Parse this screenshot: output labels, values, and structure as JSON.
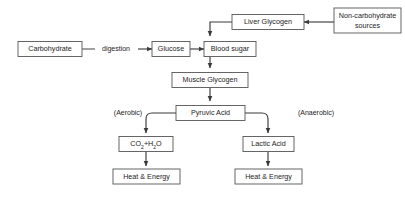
{
  "diagram": {
    "background_color": "#ffffff",
    "box_border_color": "#555555",
    "arrow_color": "#3a3a3a",
    "text_color": "#1c1c1c",
    "nodes": [
      {
        "id": "carbohydrate",
        "label": "Carbohydrate"
      },
      {
        "id": "glucose",
        "label": "Glucose"
      },
      {
        "id": "blood-sugar",
        "label": "Blood sugar"
      },
      {
        "id": "liver-glycogen",
        "label": "Liver Glycogen"
      },
      {
        "id": "non-carb-sources",
        "label_line1": "Non-carbohydrate",
        "label_line2": "sources"
      },
      {
        "id": "muscle-glycogen",
        "label": "Muscle Glycogen"
      },
      {
        "id": "pyruvic-acid",
        "label": "Pyruvic Acid"
      },
      {
        "id": "co2-h2o",
        "label_part1": "CO",
        "label_sub1": "2",
        "label_part2": "+H",
        "label_sub2": "2",
        "label_part3": "O"
      },
      {
        "id": "lactic-acid",
        "label": "Lactic Acid"
      },
      {
        "id": "heat-energy-left",
        "label": "Heat & Energy"
      },
      {
        "id": "heat-energy-right",
        "label": "Heat & Energy"
      }
    ],
    "edge_labels": [
      {
        "id": "digestion",
        "label": "digestion"
      }
    ],
    "annotations": [
      {
        "id": "aerobic",
        "label": "(Aerobic)"
      },
      {
        "id": "anaerobic",
        "label": "(Anaerobic)"
      }
    ]
  }
}
